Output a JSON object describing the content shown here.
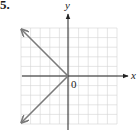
{
  "problem": {
    "number": "5."
  },
  "graph": {
    "x_axis_label": "x",
    "y_axis_label": "y",
    "origin_label": "0",
    "grid": {
      "columns": 10,
      "rows": 10,
      "color": "#d4d4d4"
    },
    "axis_color": "#222222",
    "curve_color": "#7a7a7a",
    "curve": {
      "description": "x = -|y| (sideways V opening left, vertex at origin)",
      "vertex": [
        0,
        0
      ],
      "rays": [
        {
          "from": [
            0,
            0
          ],
          "to": [
            -5,
            5
          ],
          "arrow": true
        },
        {
          "from": [
            0,
            0
          ],
          "to": [
            -5,
            -5
          ],
          "arrow": true
        }
      ]
    }
  }
}
